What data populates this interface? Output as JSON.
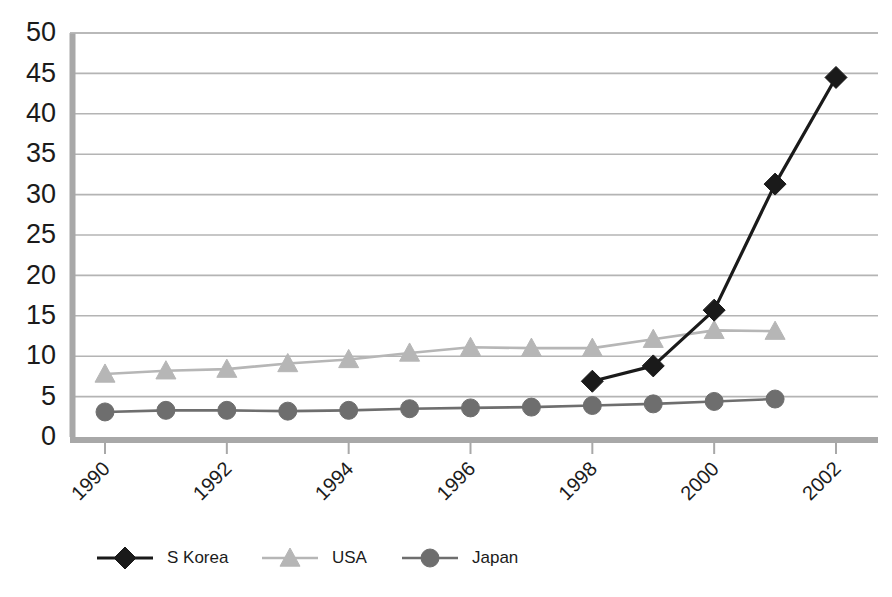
{
  "chart_data": {
    "type": "line",
    "title": "",
    "subtitle": "",
    "xlabel": "",
    "ylabel": "",
    "x": [
      1990,
      1991,
      1992,
      1993,
      1994,
      1995,
      1996,
      1997,
      1998,
      1999,
      2000,
      2001,
      2002
    ],
    "xlim": [
      1990,
      2002
    ],
    "ylim": [
      0,
      50
    ],
    "y_ticks": [
      0,
      5,
      10,
      15,
      20,
      25,
      30,
      35,
      40,
      45,
      50
    ],
    "y_tick_labels": [
      "0",
      "5",
      "10",
      "15",
      "20",
      "25",
      "30",
      "35",
      "40",
      "45",
      "50"
    ],
    "x_ticks": [
      1990,
      1992,
      1994,
      1996,
      1998,
      2000,
      2002
    ],
    "x_tick_labels": [
      "1990",
      "1992",
      "1994",
      "1996",
      "1998",
      "2000",
      "2002"
    ],
    "x_tick_rotation": -45,
    "grid": true,
    "grid_axis": "y",
    "legend_position": "bottom",
    "series": [
      {
        "name": "S Korea",
        "color": "#1a1a1a",
        "marker": "diamond",
        "x": [
          1998,
          1999,
          2000,
          2001,
          2002
        ],
        "values": [
          6.9,
          8.8,
          15.7,
          31.3,
          44.5
        ]
      },
      {
        "name": "USA",
        "color": "#b6b6b6",
        "marker": "triangle",
        "x": [
          1990,
          1991,
          1992,
          1993,
          1994,
          1995,
          1996,
          1997,
          1998,
          1999,
          2000,
          2001
        ],
        "values": [
          7.8,
          8.2,
          8.4,
          9.1,
          9.6,
          10.4,
          11.1,
          11.0,
          11.0,
          12.1,
          13.2,
          13.1
        ]
      },
      {
        "name": "Japan",
        "color": "#6e6e6e",
        "marker": "circle",
        "x": [
          1990,
          1991,
          1992,
          1993,
          1994,
          1995,
          1996,
          1997,
          1998,
          1999,
          2000,
          2001
        ],
        "values": [
          3.1,
          3.3,
          3.3,
          3.2,
          3.3,
          3.5,
          3.6,
          3.7,
          3.9,
          4.1,
          4.4,
          4.7
        ]
      }
    ]
  },
  "legend": {
    "items": [
      {
        "label": "S Korea"
      },
      {
        "label": "USA"
      },
      {
        "label": "Japan"
      }
    ]
  },
  "style": {
    "plot_background": "#ffffff",
    "gridline_color": "#b4b4b4",
    "axis_color": "#a8a8a8",
    "page_background": "#ffffff"
  }
}
